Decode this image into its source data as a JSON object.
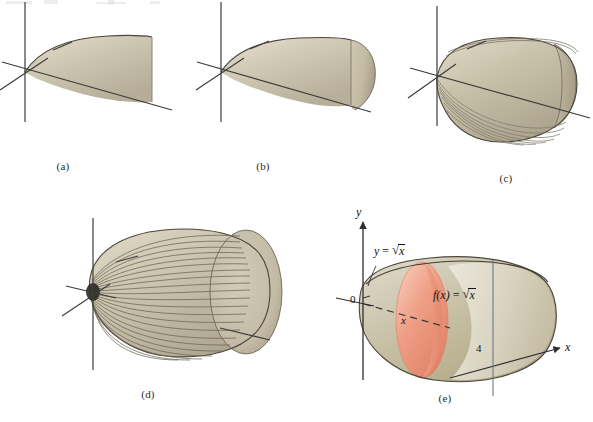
{
  "figure": {
    "title_visible": false,
    "background_color": "#ffffff",
    "panel_count": 5,
    "solid_color_light": "#ded8c6",
    "solid_color_mid": "#c9c2ab",
    "solid_color_dark": "#9a9181",
    "solid_outline_color": "#3a3730",
    "disk_color_light": "#f6c9b6",
    "disk_color_mid": "#ee9a80",
    "disk_color_dark": "#e07f63",
    "axis_color": "#3c3c3c",
    "label_color": "#111111"
  },
  "panels": [
    {
      "id": "a",
      "caption": "(a)",
      "description": "region under y = square root of x, no rotation",
      "rotation_label": "",
      "has_stripes": false,
      "stripe_count": 0,
      "has_disk": false
    },
    {
      "id": "b",
      "caption": "(b)",
      "description": "region partially swept about the x-axis",
      "rotation_label": "",
      "has_stripes": false,
      "stripe_count": 0,
      "has_disk": false
    },
    {
      "id": "c",
      "caption": "(c)",
      "description": "region swept further, ridges appearing",
      "rotation_label": "",
      "has_stripes": true,
      "stripe_count": 7,
      "has_disk": false
    },
    {
      "id": "d",
      "caption": "(d)",
      "description": "complete solid of revolution with meridian lines",
      "rotation_label": "",
      "has_stripes": true,
      "stripe_count": 22,
      "has_disk": false
    },
    {
      "id": "e",
      "caption": "(e)",
      "description": "labeled solid with representative cross-sectional disk",
      "has_stripes": false,
      "stripe_count": 0,
      "has_disk": true,
      "labels": {
        "y_axis": "y",
        "x_axis": "x",
        "origin": "0",
        "x_tick": "4",
        "radius_label": "x",
        "curve_equation": "y = √x",
        "radius_equation": "f(x) = √x",
        "curve_equation_parts": {
          "lhs": "y",
          "eq": "=",
          "radicand": "x"
        },
        "radius_equation_parts": {
          "lhs": "f(x)",
          "eq": "=",
          "radicand": "x"
        }
      }
    }
  ],
  "math": {
    "function": "y = √x",
    "interval_start": "0",
    "interval_end": "4",
    "cross_section_radius": "f(x) = √x",
    "axis_of_revolution": "x"
  }
}
